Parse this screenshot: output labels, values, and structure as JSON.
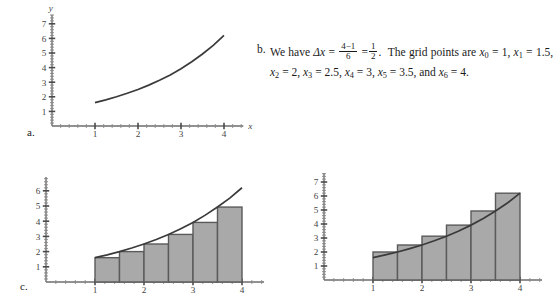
{
  "parts": {
    "a_label": "a.",
    "b_label": "b.",
    "c_label": "c."
  },
  "solution_text": {
    "lead": "We have",
    "delta_symbol": "Δx",
    "equals": "=",
    "frac1_num": "4−1",
    "frac1_den": "6",
    "frac2_num": "1",
    "frac2_den": "2",
    "period": ".",
    "grid_intro": "The grid points are",
    "x0_name": "x",
    "x0_sub": "0",
    "x0_val": "1",
    "x1_name": "x",
    "x1_sub": "1",
    "x1_val": "1.5",
    "x2_name": "x",
    "x2_sub": "2",
    "x2_val": "2",
    "x3_name": "x",
    "x3_sub": "3",
    "x3_val": "2.5",
    "x4_name": "x",
    "x4_sub": "4",
    "x4_val": "3",
    "x5_name": "x",
    "x5_sub": "5",
    "x5_val": "3.5",
    "and_word": "and",
    "x6_name": "x",
    "x6_sub": "6",
    "x6_val": "4",
    "full_text": "We have Δx = (4−1)/6 = 1/2. The grid points are x0 = 1, x1 = 1.5, x2 = 2, x3 = 2.5, x4 = 3, x5 = 3.5, and x6 = 4."
  },
  "chart_data": [
    {
      "id": "panel-a-curve",
      "type": "line",
      "title": "",
      "xlabel": "x",
      "ylabel": "y",
      "xlim": [
        0,
        4.45
      ],
      "ylim": [
        0,
        7.6
      ],
      "xticks": [
        1,
        2,
        3,
        4
      ],
      "xticklabels": [
        "1",
        "2",
        "3",
        "4"
      ],
      "yticks": [
        1,
        2,
        3,
        4,
        5,
        6,
        7
      ],
      "yticklabels": [
        "1",
        "2",
        "3",
        "4",
        "5",
        "6",
        "7"
      ],
      "grid": false,
      "legend": "none",
      "series": [
        {
          "name": "f(x)",
          "x": [
            1.0,
            1.25,
            1.5,
            1.75,
            2.0,
            2.25,
            2.5,
            2.75,
            3.0,
            3.25,
            3.5,
            3.75,
            4.0
          ],
          "y": [
            1.6,
            1.79,
            2.0,
            2.24,
            2.5,
            2.8,
            3.13,
            3.5,
            3.92,
            4.4,
            4.93,
            5.52,
            6.2
          ]
        }
      ]
    },
    {
      "id": "panel-c-left-lower-sum",
      "type": "bar",
      "title": "",
      "note": "left-endpoint (lower) Riemann sum, n = 6",
      "xlabel": "",
      "ylabel": "",
      "xlim": [
        0,
        4.45
      ],
      "ylim": [
        0,
        6.9
      ],
      "xticks": [
        1,
        2,
        3,
        4
      ],
      "xticklabels": [
        "1",
        "2",
        "3",
        "4"
      ],
      "yticks": [
        1,
        2,
        3,
        4,
        5,
        6
      ],
      "yticklabels": [
        "1",
        "2",
        "3",
        "4",
        "5",
        "6"
      ],
      "grid": false,
      "legend": "none",
      "bar_left_edges": [
        1.0,
        1.5,
        2.0,
        2.5,
        3.0,
        3.5
      ],
      "bar_width": 0.5,
      "categories": [
        "[1,1.5]",
        "[1.5,2]",
        "[2,2.5]",
        "[2.5,3]",
        "[3,3.5]",
        "[3.5,4]"
      ],
      "values": [
        1.6,
        2.0,
        2.5,
        3.13,
        3.92,
        4.93
      ],
      "curve": {
        "x": [
          1.0,
          1.25,
          1.5,
          1.75,
          2.0,
          2.25,
          2.5,
          2.75,
          3.0,
          3.25,
          3.5,
          3.75,
          4.0
        ],
        "y": [
          1.6,
          1.79,
          2.0,
          2.24,
          2.5,
          2.8,
          3.13,
          3.5,
          3.92,
          4.4,
          4.93,
          5.52,
          6.2
        ]
      }
    },
    {
      "id": "panel-c-right-upper-sum",
      "type": "bar",
      "title": "",
      "note": "right-endpoint (upper) Riemann sum, n = 6",
      "xlabel": "",
      "ylabel": "",
      "xlim": [
        0,
        4.45
      ],
      "ylim": [
        0,
        7.6
      ],
      "xticks": [
        1,
        2,
        3,
        4
      ],
      "xticklabels": [
        "1",
        "2",
        "3",
        "4"
      ],
      "yticks": [
        1,
        2,
        3,
        4,
        5,
        6,
        7
      ],
      "yticklabels": [
        "1",
        "2",
        "3",
        "4",
        "5",
        "6",
        "7"
      ],
      "grid": false,
      "legend": "none",
      "bar_left_edges": [
        1.0,
        1.5,
        2.0,
        2.5,
        3.0,
        3.5
      ],
      "bar_width": 0.5,
      "categories": [
        "[1,1.5]",
        "[1.5,2]",
        "[2,2.5]",
        "[2.5,3]",
        "[3,3.5]",
        "[3.5,4]"
      ],
      "values": [
        2.0,
        2.5,
        3.13,
        3.92,
        4.93,
        6.2
      ],
      "curve": {
        "x": [
          1.0,
          1.25,
          1.5,
          1.75,
          2.0,
          2.25,
          2.5,
          2.75,
          3.0,
          3.25,
          3.5,
          3.75,
          4.0
        ],
        "y": [
          1.6,
          1.79,
          2.0,
          2.24,
          2.5,
          2.8,
          3.13,
          3.5,
          3.92,
          4.4,
          4.93,
          5.52,
          6.2
        ]
      }
    }
  ]
}
